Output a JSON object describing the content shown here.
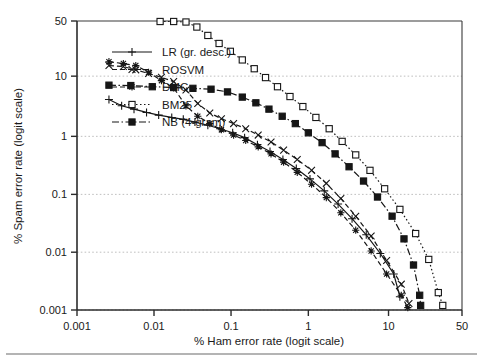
{
  "figure": {
    "background_color": "#ffffff",
    "ink_color": "#161616",
    "grid_color": "#b9b9b9"
  },
  "chart_data": {
    "type": "line",
    "title": "",
    "xlabel": "% Ham error rate (logit scale)",
    "ylabel": "% Spam error rate (logit scale)",
    "x_scale": "logit",
    "y_scale": "logit",
    "y_inverted": true,
    "grid": true,
    "xlim": [
      0.001,
      50
    ],
    "ylim": [
      0.001,
      50
    ],
    "xticks": [
      0.001,
      0.01,
      0.1,
      1,
      10,
      50
    ],
    "xtick_labels": [
      "0.001",
      "0.01",
      "0.1",
      "1",
      "10",
      "50"
    ],
    "yticks": [
      0.001,
      0.01,
      0.1,
      1,
      10,
      50
    ],
    "ytick_labels": [
      "0.001",
      "0.01",
      "0.1",
      "1",
      "10",
      "50"
    ],
    "legend_position": "upper-left-inside",
    "series": [
      {
        "name": "LR (gr. desc.)",
        "marker": "plus",
        "linestyle": "solid",
        "points": [
          [
            0.0026,
            4.2
          ],
          [
            0.0038,
            3.3
          ],
          [
            0.0055,
            2.9
          ],
          [
            0.008,
            2.55
          ],
          [
            0.0115,
            2.3
          ],
          [
            0.017,
            2.1
          ],
          [
            0.024,
            1.95
          ],
          [
            0.034,
            1.75
          ],
          [
            0.05,
            1.55
          ],
          [
            0.072,
            1.35
          ],
          [
            0.105,
            1.15
          ],
          [
            0.15,
            0.95
          ],
          [
            0.22,
            0.72
          ],
          [
            0.32,
            0.55
          ],
          [
            0.47,
            0.4
          ],
          [
            0.7,
            0.28
          ],
          [
            1.05,
            0.185
          ],
          [
            1.6,
            0.115
          ],
          [
            2.4,
            0.068
          ],
          [
            3.6,
            0.038
          ],
          [
            5.4,
            0.02
          ],
          [
            8.0,
            0.0095
          ],
          [
            11.5,
            0.0042
          ],
          [
            13.5,
            0.0017
          ]
        ]
      },
      {
        "name": "ROSVM",
        "marker": "x",
        "linestyle": "dashed",
        "points": [
          [
            0.0026,
            14.5
          ],
          [
            0.004,
            14.0
          ],
          [
            0.0058,
            12.5
          ],
          [
            0.0085,
            11.0
          ],
          [
            0.0125,
            9.6
          ],
          [
            0.018,
            8.2
          ],
          [
            0.026,
            6.0
          ],
          [
            0.037,
            3.6
          ],
          [
            0.053,
            2.5
          ],
          [
            0.075,
            2.0
          ],
          [
            0.108,
            1.65
          ],
          [
            0.155,
            1.35
          ],
          [
            0.225,
            1.05
          ],
          [
            0.33,
            0.8
          ],
          [
            0.48,
            0.58
          ],
          [
            0.72,
            0.4
          ],
          [
            1.1,
            0.26
          ],
          [
            1.7,
            0.155
          ],
          [
            2.6,
            0.085
          ],
          [
            4.0,
            0.042
          ],
          [
            6.2,
            0.019
          ],
          [
            9.5,
            0.0072
          ],
          [
            14.0,
            0.0028
          ],
          [
            17.0,
            0.0013
          ]
        ]
      },
      {
        "name": "DMC",
        "marker": "star",
        "linestyle": "dashed",
        "points": [
          [
            0.0026,
            16.5
          ],
          [
            0.004,
            15.5
          ],
          [
            0.0058,
            14.5
          ],
          [
            0.0085,
            11.5
          ],
          [
            0.0125,
            8.5
          ],
          [
            0.018,
            6.5
          ],
          [
            0.026,
            3.3
          ],
          [
            0.037,
            2.2
          ],
          [
            0.053,
            1.65
          ],
          [
            0.075,
            1.3
          ],
          [
            0.108,
            1.05
          ],
          [
            0.155,
            0.85
          ],
          [
            0.225,
            0.66
          ],
          [
            0.33,
            0.5
          ],
          [
            0.48,
            0.36
          ],
          [
            0.72,
            0.24
          ],
          [
            1.1,
            0.15
          ],
          [
            1.7,
            0.088
          ],
          [
            2.6,
            0.048
          ],
          [
            4.0,
            0.024
          ],
          [
            6.2,
            0.0105
          ],
          [
            9.5,
            0.0042
          ],
          [
            14.0,
            0.0018
          ],
          [
            16.5,
            0.0011
          ]
        ]
      },
      {
        "name": "BM25",
        "marker": "open-square",
        "linestyle": "dotted",
        "points": [
          [
            0.012,
            49.5
          ],
          [
            0.018,
            49.5
          ],
          [
            0.026,
            49.0
          ],
          [
            0.036,
            44.0
          ],
          [
            0.05,
            36.0
          ],
          [
            0.07,
            29.0
          ],
          [
            0.098,
            23.0
          ],
          [
            0.14,
            17.5
          ],
          [
            0.2,
            13.0
          ],
          [
            0.28,
            9.5
          ],
          [
            0.4,
            6.8
          ],
          [
            0.58,
            4.7
          ],
          [
            0.85,
            3.2
          ],
          [
            1.25,
            2.1
          ],
          [
            1.85,
            1.35
          ],
          [
            2.7,
            0.82
          ],
          [
            4.0,
            0.48
          ],
          [
            6.0,
            0.26
          ],
          [
            9.0,
            0.125
          ],
          [
            13.5,
            0.055
          ],
          [
            20.0,
            0.021
          ],
          [
            27.0,
            0.0075
          ],
          [
            33.0,
            0.002
          ],
          [
            36.0,
            0.0012
          ]
        ]
      },
      {
        "name": "NB (4-gram)",
        "marker": "filled-square",
        "linestyle": "dash-dot",
        "points": [
          [
            0.0026,
            7.2
          ],
          [
            0.005,
            7.1
          ],
          [
            0.0095,
            6.8
          ],
          [
            0.018,
            6.6
          ],
          [
            0.032,
            6.4
          ],
          [
            0.055,
            6.2
          ],
          [
            0.09,
            5.6
          ],
          [
            0.14,
            4.6
          ],
          [
            0.21,
            3.7
          ],
          [
            0.31,
            2.9
          ],
          [
            0.46,
            2.2
          ],
          [
            0.68,
            1.65
          ],
          [
            1.0,
            1.15
          ],
          [
            1.5,
            0.78
          ],
          [
            2.2,
            0.5
          ],
          [
            3.3,
            0.3
          ],
          [
            5.0,
            0.17
          ],
          [
            7.4,
            0.09
          ],
          [
            11.0,
            0.042
          ],
          [
            15.0,
            0.017
          ],
          [
            19.0,
            0.006
          ],
          [
            22.0,
            0.0018
          ],
          [
            22.5,
            0.0012
          ]
        ]
      }
    ]
  },
  "legend": {
    "items": [
      {
        "label": "LR (gr. desc.)",
        "marker": "plus",
        "linestyle": "solid"
      },
      {
        "label": "ROSVM",
        "marker": "x",
        "linestyle": "dashed"
      },
      {
        "label": "DMC",
        "marker": "star",
        "linestyle": "dashed"
      },
      {
        "label": "BM25",
        "marker": "open-square",
        "linestyle": "dotted"
      },
      {
        "label": "NB (4-gram)",
        "marker": "filled-square",
        "linestyle": "dash-dot"
      }
    ]
  }
}
